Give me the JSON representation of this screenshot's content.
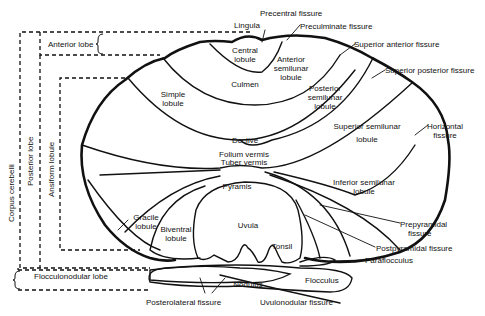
{
  "diagram": {
    "lobe_labels": {
      "anterior_lobe": "Anterior lobe",
      "posterior_lobe": "Posterior lobe",
      "ansiform_lobule": "Ansiform lobule",
      "corpus_cerebelli": "Corpus cerebelli",
      "flocculonodular_lobe": "Flocculonodular lobe"
    },
    "regions": {
      "lingula": "Lingula",
      "central_lobule": [
        "Central",
        "lobule"
      ],
      "anterior_semilunar_lobule": [
        "Anterior",
        "semilunar",
        "lobule"
      ],
      "culmen": "Culmen",
      "simple_lobule": [
        "Simple",
        "lobule"
      ],
      "posterior_semilunar_lobule": [
        "Posterior",
        "semilunar",
        "lobule"
      ],
      "declive": "Declive",
      "superior_semilunar_lobule": [
        "Superior semilunar",
        "lobule"
      ],
      "folium_vermis": "Folium vermis",
      "tuber_vermis": "Tuber vermis",
      "inferior_semilunar_lobule": [
        "Inferior semilunar",
        "lobule"
      ],
      "pyramis": "Pyramis",
      "gracile_lobule": [
        "Gracile",
        "lobule"
      ],
      "biventral_lobule": [
        "Biventral",
        "lobule"
      ],
      "uvula": "Uvula",
      "tonsil": "Tonsil",
      "nodulus": "Nodulus",
      "flocculus": "Flocculus"
    },
    "fissures": {
      "precentral": "Precentral fissure",
      "preculminate": "Preculminate fissure",
      "superior_anterior": "Superior anterior fissure",
      "superior_posterior": "Superior posterior fissure",
      "horizontal": [
        "Horizontal",
        "fissure"
      ],
      "prepyramidal": [
        "Prepyramidal",
        "fissure"
      ],
      "postpyramidal": "Postpyramidal fissure",
      "paraflocculus": "Paraflocculus",
      "posterolateral": "Posterolateral  fissure",
      "uvulonodular": "Uvulonodular fissure"
    }
  }
}
